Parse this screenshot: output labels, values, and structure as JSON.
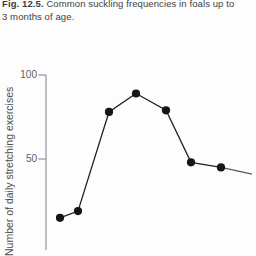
{
  "caption": {
    "fig": "Fig. 12.5.",
    "line1_rest": "Common suckling frequencies in foals up to",
    "line2": "3 months of age."
  },
  "chart_data": {
    "type": "line",
    "title": "Fig. 12.5. Common suckling frequencies in foals up to 3 months of age.",
    "ylabel": "Number of daily stretching exercises",
    "yticks": [
      100,
      50
    ],
    "ylim": [
      0,
      100
    ],
    "grid": false,
    "legend": false,
    "x_axis_labels_visible": false,
    "values": [
      15,
      19,
      78,
      89,
      79,
      48,
      45
    ],
    "x_px": [
      60,
      78,
      109,
      136,
      166,
      191,
      221
    ],
    "trail": {
      "value": 41,
      "x_px": 252
    },
    "line_color": "#222222",
    "point_color": "#151515",
    "axis_color": "#8a8a8a"
  }
}
